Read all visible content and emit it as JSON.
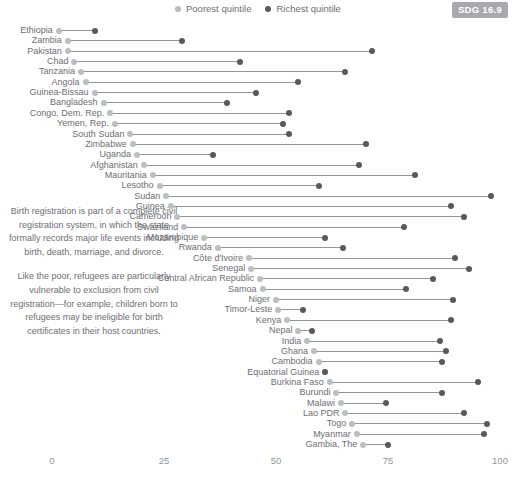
{
  "legend": {
    "items": [
      {
        "label": "Poorest quintile",
        "icon": "poor-dot-icon",
        "color": "#b9bbbd"
      },
      {
        "label": "Richest quintile",
        "icon": "rich-dot-icon",
        "color": "#58595b"
      }
    ]
  },
  "badge": {
    "label": "SDG 16.9",
    "color": "#a7a9ac"
  },
  "annotation": {
    "paragraph1": "Birth registration is part of a complete civil registration system, in which the state formally records major life events including birth, death, marriage, and divorce.",
    "paragraph2": "Like the poor, refugees are particularly vulnerable to exclusion from civil registration—for example, children born to refugees may be ineligible for birth certificates in their host countries."
  },
  "chart_data": {
    "type": "scatter",
    "subtype": "dumbbell",
    "title": "",
    "xlabel": "",
    "ylabel": "",
    "xlim": [
      0,
      100
    ],
    "xticks": [
      0,
      25,
      50,
      75,
      100
    ],
    "xtick_labels": [
      "0",
      "25",
      "50",
      "75",
      "100"
    ],
    "grid": false,
    "legend_position": "top-center",
    "series": [
      {
        "name": "Poorest quintile",
        "color": "#bcbec0"
      },
      {
        "name": "Richest quintile",
        "color": "#58595b"
      }
    ],
    "categories": [
      "Ethiopia",
      "Zambia",
      "Pakistan",
      "Chad",
      "Tanzania",
      "Angola",
      "Guinea-Bissau",
      "Bangladesh",
      "Congo, Dem. Rep.",
      "Yemen, Rep.",
      "South Sudan",
      "Zimbabwe",
      "Uganda",
      "Afghanistan",
      "Mauritania",
      "Lesotho",
      "Sudan",
      "Guinea",
      "Cameroon",
      "Swaziland",
      "Mozambique",
      "Rwanda",
      "Côte d'Ivoire",
      "Senegal",
      "Central African Republic",
      "Samoa",
      "Niger",
      "Timor-Leste",
      "Kenya",
      "Nepal",
      "India",
      "Ghana",
      "Cambodia",
      "Equatorial Guinea",
      "Burkina Faso",
      "Burundi",
      "Malawi",
      "Lao PDR",
      "Togo",
      "Myanmar",
      "Gambia, The"
    ],
    "points": [
      {
        "category": "Ethiopia",
        "poorest": 1.5,
        "richest": 9.5
      },
      {
        "category": "Zambia",
        "poorest": 3.5,
        "richest": 29.0
      },
      {
        "category": "Pakistan",
        "poorest": 3.5,
        "richest": 71.5
      },
      {
        "category": "Chad",
        "poorest": 5.0,
        "richest": 42.0
      },
      {
        "category": "Tanzania",
        "poorest": 6.5,
        "richest": 65.5
      },
      {
        "category": "Angola",
        "poorest": 7.5,
        "richest": 55.0
      },
      {
        "category": "Guinea-Bissau",
        "poorest": 9.5,
        "richest": 45.5
      },
      {
        "category": "Bangladesh",
        "poorest": 11.5,
        "richest": 39.0
      },
      {
        "category": "Congo, Dem. Rep.",
        "poorest": 13.0,
        "richest": 53.0
      },
      {
        "category": "Yemen, Rep.",
        "poorest": 14.0,
        "richest": 51.5
      },
      {
        "category": "South Sudan",
        "poorest": 17.5,
        "richest": 53.0
      },
      {
        "category": "Zimbabwe",
        "poorest": 18.0,
        "richest": 70.0
      },
      {
        "category": "Uganda",
        "poorest": 19.0,
        "richest": 36.0
      },
      {
        "category": "Afghanistan",
        "poorest": 20.5,
        "richest": 68.5
      },
      {
        "category": "Mauritania",
        "poorest": 22.5,
        "richest": 81.0
      },
      {
        "category": "Lesotho",
        "poorest": 24.0,
        "richest": 59.5
      },
      {
        "category": "Sudan",
        "poorest": 25.5,
        "richest": 98.0
      },
      {
        "category": "Guinea",
        "poorest": 26.5,
        "richest": 89.0
      },
      {
        "category": "Cameroon",
        "poorest": 28.0,
        "richest": 92.0
      },
      {
        "category": "Swaziland",
        "poorest": 29.5,
        "richest": 78.5
      },
      {
        "category": "Mozambique",
        "poorest": 34.0,
        "richest": 61.0
      },
      {
        "category": "Rwanda",
        "poorest": 37.0,
        "richest": 65.0
      },
      {
        "category": "Côte d'Ivoire",
        "poorest": 44.0,
        "richest": 90.0
      },
      {
        "category": "Senegal",
        "poorest": 44.5,
        "richest": 93.0
      },
      {
        "category": "Central African Republic",
        "poorest": 46.5,
        "richest": 85.0
      },
      {
        "category": "Samoa",
        "poorest": 47.0,
        "richest": 79.0
      },
      {
        "category": "Niger",
        "poorest": 50.0,
        "richest": 89.5
      },
      {
        "category": "Timor-Leste",
        "poorest": 50.5,
        "richest": 56.0
      },
      {
        "category": "Kenya",
        "poorest": 52.5,
        "richest": 89.0
      },
      {
        "category": "Nepal",
        "poorest": 55.0,
        "richest": 58.0
      },
      {
        "category": "India",
        "poorest": 57.0,
        "richest": 86.5
      },
      {
        "category": "Ghana",
        "poorest": 58.5,
        "richest": 88.0
      },
      {
        "category": "Cambodia",
        "poorest": 59.5,
        "richest": 87.0
      },
      {
        "category": "Equatorial Guinea",
        "poorest": 61.0,
        "richest": 61.0
      },
      {
        "category": "Burkina Faso",
        "poorest": 62.0,
        "richest": 95.0
      },
      {
        "category": "Burundi",
        "poorest": 63.5,
        "richest": 87.0
      },
      {
        "category": "Malawi",
        "poorest": 64.5,
        "richest": 74.5
      },
      {
        "category": "Lao PDR",
        "poorest": 65.5,
        "richest": 92.0
      },
      {
        "category": "Togo",
        "poorest": 67.0,
        "richest": 97.0
      },
      {
        "category": "Myanmar",
        "poorest": 68.0,
        "richest": 96.5
      },
      {
        "category": "Gambia, The",
        "poorest": 69.5,
        "richest": 75.0
      }
    ]
  }
}
